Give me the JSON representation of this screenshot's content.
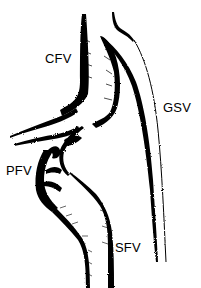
{
  "diagram": {
    "type": "anatomical-vein-illustration",
    "colors": {
      "ink": "#000000",
      "background": "#ffffff"
    },
    "labels": {
      "cfv": "CFV",
      "gsv": "GSV",
      "pfv": "PFV",
      "sfv": "SFV"
    }
  }
}
